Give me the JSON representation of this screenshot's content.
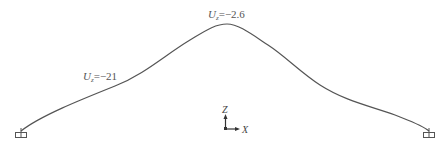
{
  "diagram": {
    "curve_color": "#555555",
    "labels": {
      "peak": {
        "var": "U",
        "sub": "z",
        "value": "=−2.6"
      },
      "left": {
        "var": "U",
        "sub": "z",
        "value": "=−21"
      }
    },
    "axes": {
      "z_label": "Z",
      "x_label": "X"
    },
    "supports": [
      {
        "name": "left-support",
        "x": 21,
        "y": 131
      },
      {
        "name": "right-support",
        "x": 429,
        "y": 131
      }
    ]
  }
}
